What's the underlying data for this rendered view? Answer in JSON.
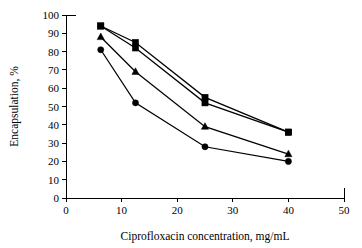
{
  "chart_data": {
    "type": "line",
    "title": "",
    "xlabel": "Ciprofloxacin concentration, mg/mL",
    "ylabel": "Encapsulation, %",
    "xlim": [
      0,
      50
    ],
    "ylim": [
      0,
      100
    ],
    "xticks": [
      0,
      10,
      20,
      30,
      40,
      50
    ],
    "yticks": [
      0,
      10,
      20,
      30,
      40,
      50,
      60,
      70,
      80,
      90,
      100
    ],
    "xtick_labels": [
      "0",
      "10",
      "20",
      "30",
      "40",
      "50"
    ],
    "ytick_labels": [
      "0",
      "10",
      "20",
      "30",
      "40",
      "50",
      "60",
      "70",
      "80",
      "90",
      "100"
    ],
    "grid": false,
    "legend": "none",
    "x": [
      6.25,
      12.5,
      25,
      40
    ],
    "series": [
      {
        "name": "series-1",
        "marker": "square",
        "color": "#000000",
        "values": [
          94,
          85,
          55,
          36
        ]
      },
      {
        "name": "series-2",
        "marker": "square",
        "color": "#000000",
        "values": [
          94,
          82,
          52,
          36
        ]
      },
      {
        "name": "series-3",
        "marker": "triangle",
        "color": "#000000",
        "values": [
          88,
          69,
          39,
          24
        ]
      },
      {
        "name": "series-4",
        "marker": "circle",
        "color": "#000000",
        "values": [
          81,
          52,
          28,
          20
        ]
      }
    ]
  },
  "figure": {
    "background": "#ffffff",
    "axis_color": "#000000"
  }
}
